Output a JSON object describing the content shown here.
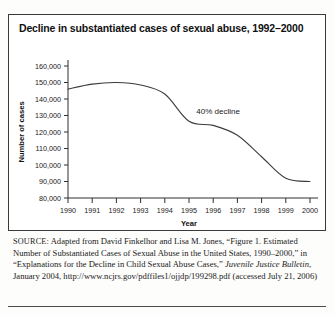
{
  "figure": {
    "title": "Decline in substantiated cases of sexual abuse, 1992–2000",
    "source_label": "SOURCE:",
    "source_text_1": " Adapted from David Finkelhor and Lisa M. Jones, “Figure 1. Estimated Number of Substantiated Cases of Sexual Abuse in the United States, 1990–2000,” in “Explanations for the Decline in Child Sexual Abuse Cases,” ",
    "source_italic": "Juvenile Justice Bulletin",
    "source_text_2": ", January 2004, http://www.ncjrs.gov/pdffiles1/ojjdp/199298.pdf (accessed July 21, 2006)"
  },
  "chart_data": {
    "type": "line",
    "title": "Decline in substantiated cases of sexual abuse, 1992–2000",
    "xlabel": "Year",
    "ylabel": "Number of cases",
    "x": [
      1990,
      1991,
      1992,
      1993,
      1994,
      1995,
      1996,
      1997,
      1998,
      1999,
      2000
    ],
    "categories": [
      "1990",
      "1991",
      "1992",
      "1993",
      "1994",
      "1995",
      "1996",
      "1997",
      "1998",
      "1999",
      "2000"
    ],
    "values": [
      146000,
      149000,
      150000,
      148500,
      143000,
      126500,
      124000,
      118000,
      105000,
      92000,
      90000
    ],
    "series": [
      {
        "name": "Substantiated cases of sexual abuse",
        "values": [
          146000,
          149000,
          150000,
          148500,
          143000,
          126500,
          124000,
          118000,
          105000,
          92000,
          90000
        ]
      }
    ],
    "ylim": [
      80000,
      160000
    ],
    "xlim": [
      1990,
      2000
    ],
    "ytick_labels": [
      "160,000",
      "150,000",
      "140,000",
      "130,000",
      "120,000",
      "110,000",
      "100,000",
      "90,000",
      "80,000"
    ],
    "ytick_values": [
      160000,
      150000,
      140000,
      130000,
      120000,
      110000,
      100000,
      90000,
      80000
    ],
    "grid": false,
    "legend": false,
    "line_color": "#3c3c3c",
    "annotations": [
      {
        "text": "40% decline",
        "x": 1995.3,
        "y": 131000
      }
    ]
  }
}
